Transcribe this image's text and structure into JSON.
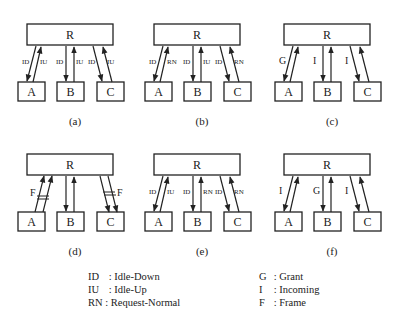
{
  "panels": [
    {
      "id": "a",
      "caption": "(a)",
      "x": 0,
      "y": 0,
      "node_root": "R",
      "nodes": [
        "A",
        "B",
        "C"
      ],
      "links": [
        {
          "node": "A",
          "down": "ID",
          "up": "IU"
        },
        {
          "node": "B",
          "down": "ID",
          "up": "IU"
        },
        {
          "node": "C",
          "down": "ID",
          "up": "IU"
        }
      ]
    },
    {
      "id": "b",
      "caption": "(b)",
      "x": 127,
      "y": 0,
      "node_root": "R",
      "nodes": [
        "A",
        "B",
        "C"
      ],
      "links": [
        {
          "node": "A",
          "down": "ID",
          "up": "RN"
        },
        {
          "node": "B",
          "down": "ID",
          "up": "IU"
        },
        {
          "node": "C",
          "down": "ID",
          "up": "RN"
        }
      ]
    },
    {
      "id": "c",
      "caption": "(c)",
      "x": 257,
      "y": 0,
      "node_root": "R",
      "nodes": [
        "A",
        "B",
        "C"
      ],
      "links": [
        {
          "node": "A",
          "down": "G",
          "up": ""
        },
        {
          "node": "B",
          "down": "I",
          "up": ""
        },
        {
          "node": "C",
          "down": "I",
          "up": ""
        }
      ]
    },
    {
      "id": "d",
      "caption": "(d)",
      "x": 0,
      "y": 130,
      "node_root": "R",
      "nodes": [
        "A",
        "B",
        "C"
      ],
      "links": [
        {
          "node": "A",
          "down": "",
          "up": "F",
          "frame": "up"
        },
        {
          "node": "B",
          "down": "",
          "up": ""
        },
        {
          "node": "C",
          "down": "",
          "up": "F",
          "frame": "down"
        }
      ]
    },
    {
      "id": "e",
      "caption": "(e)",
      "x": 127,
      "y": 130,
      "node_root": "R",
      "nodes": [
        "A",
        "B",
        "C"
      ],
      "links": [
        {
          "node": "A",
          "down": "ID",
          "up": "IU"
        },
        {
          "node": "B",
          "down": "ID",
          "up": "RN"
        },
        {
          "node": "C",
          "down": "ID",
          "up": "RN"
        }
      ]
    },
    {
      "id": "f",
      "caption": "(f)",
      "x": 257,
      "y": 130,
      "node_root": "R",
      "nodes": [
        "A",
        "B",
        "C"
      ],
      "links": [
        {
          "node": "A",
          "down": "I",
          "up": ""
        },
        {
          "node": "B",
          "down": "G",
          "up": ""
        },
        {
          "node": "C",
          "down": "I",
          "up": ""
        }
      ]
    }
  ],
  "legend": {
    "left": [
      {
        "abbr": "ID",
        "sep": " : ",
        "meaning": "Idle-Down"
      },
      {
        "abbr": "IU",
        "sep": " : ",
        "meaning": "Idle-Up"
      },
      {
        "abbr": "RN",
        "sep": " : ",
        "meaning": "Request-Normal"
      }
    ],
    "right": [
      {
        "abbr": "G",
        "sep": " : ",
        "meaning": "Grant"
      },
      {
        "abbr": "I",
        "sep": " : ",
        "meaning": "Incoming"
      },
      {
        "abbr": "F",
        "sep": " : ",
        "meaning": "Frame"
      }
    ]
  },
  "colors": {
    "stroke": "#222222",
    "background": "#ffffff"
  }
}
